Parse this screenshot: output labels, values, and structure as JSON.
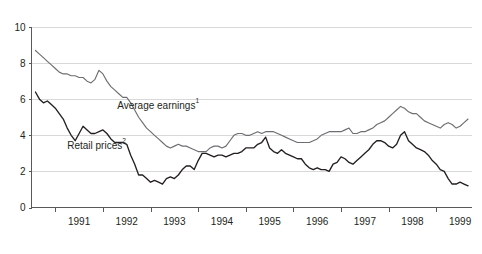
{
  "chart_data": {
    "type": "line",
    "title": "",
    "subtitle": "",
    "xlabel": "",
    "ylabel": "",
    "ylim": [
      0,
      10
    ],
    "xlim": [
      1990.5,
      1999.75
    ],
    "grid": true,
    "legend_position": "inline-annotation",
    "y_ticks": [
      0,
      2,
      4,
      6,
      8,
      10
    ],
    "y_tick_labels": [
      "0",
      "2",
      "4",
      "6",
      "8",
      "10"
    ],
    "x_tick_labels": [
      "1991",
      "1992",
      "1993",
      "1994",
      "1995",
      "1996",
      "1997",
      "1998",
      "1999"
    ],
    "x_tick_positions": [
      1991,
      1992,
      1993,
      1994,
      1995,
      1996,
      1997,
      1998,
      1999
    ],
    "x_boundary_ticks": [
      1991.0,
      1992.0,
      1993.0,
      1994.0,
      1995.0,
      1996.0,
      1997.0,
      1998.0,
      1999.0
    ],
    "annotations": [
      {
        "text": "Average earnings",
        "superscript": "1",
        "x": 1992.3,
        "y": 5.45
      },
      {
        "text": "Retail prices",
        "superscript": "2",
        "x": 1991.25,
        "y": 3.25
      }
    ],
    "series": [
      {
        "name": "Average earnings",
        "superscript": "1",
        "color": "#6d6e71",
        "x": [
          1990.583,
          1990.667,
          1990.75,
          1990.833,
          1990.917,
          1991.0,
          1991.083,
          1991.167,
          1991.25,
          1991.333,
          1991.417,
          1991.5,
          1991.583,
          1991.667,
          1991.75,
          1991.833,
          1991.917,
          1992.0,
          1992.083,
          1992.167,
          1992.25,
          1992.333,
          1992.417,
          1992.5,
          1992.583,
          1992.667,
          1992.75,
          1992.833,
          1992.917,
          1993.0,
          1993.083,
          1993.167,
          1993.25,
          1993.333,
          1993.417,
          1993.5,
          1993.583,
          1993.667,
          1993.75,
          1993.833,
          1993.917,
          1994.0,
          1994.083,
          1994.167,
          1994.25,
          1994.333,
          1994.417,
          1994.5,
          1994.583,
          1994.667,
          1994.75,
          1994.833,
          1994.917,
          1995.0,
          1995.083,
          1995.167,
          1995.25,
          1995.333,
          1995.417,
          1995.5,
          1995.583,
          1995.667,
          1995.75,
          1995.833,
          1995.917,
          1996.0,
          1996.083,
          1996.167,
          1996.25,
          1996.333,
          1996.417,
          1996.5,
          1996.583,
          1996.667,
          1996.75,
          1996.833,
          1996.917,
          1997.0,
          1997.083,
          1997.167,
          1997.25,
          1997.333,
          1997.417,
          1997.5,
          1997.583,
          1997.667,
          1997.75,
          1997.833,
          1997.917,
          1998.0,
          1998.083,
          1998.167,
          1998.25,
          1998.333,
          1998.417,
          1998.5,
          1998.583,
          1998.667,
          1998.75,
          1998.833,
          1998.917,
          1999.0,
          1999.083,
          1999.167,
          1999.25,
          1999.333,
          1999.417,
          1999.5,
          1999.583,
          1999.667
        ],
        "values": [
          8.7,
          8.5,
          8.3,
          8.1,
          7.9,
          7.7,
          7.5,
          7.4,
          7.4,
          7.3,
          7.3,
          7.2,
          7.2,
          7.0,
          6.9,
          7.1,
          7.6,
          7.4,
          7.0,
          6.7,
          6.5,
          6.3,
          6.1,
          6.1,
          5.8,
          5.4,
          5.0,
          4.7,
          4.4,
          4.2,
          4.0,
          3.8,
          3.6,
          3.4,
          3.3,
          3.4,
          3.5,
          3.4,
          3.4,
          3.3,
          3.2,
          3.1,
          3.1,
          3.1,
          3.3,
          3.4,
          3.4,
          3.3,
          3.4,
          3.7,
          4.0,
          4.1,
          4.1,
          4.0,
          4.0,
          4.1,
          4.2,
          4.1,
          4.2,
          4.2,
          4.2,
          4.1,
          4.0,
          3.9,
          3.8,
          3.7,
          3.6,
          3.6,
          3.6,
          3.6,
          3.7,
          3.8,
          4.0,
          4.1,
          4.2,
          4.2,
          4.2,
          4.2,
          4.3,
          4.4,
          4.1,
          4.1,
          4.2,
          4.2,
          4.3,
          4.4,
          4.6,
          4.7,
          4.8,
          5.0,
          5.2,
          5.4,
          5.6,
          5.5,
          5.3,
          5.2,
          5.2,
          5.0,
          4.8,
          4.7,
          4.6,
          4.5,
          4.4,
          4.6,
          4.7,
          4.6,
          4.4,
          4.5,
          4.7,
          4.9
        ]
      },
      {
        "name": "Retail prices",
        "superscript": "2",
        "color": "#231f20",
        "x": [
          1990.583,
          1990.667,
          1990.75,
          1990.833,
          1990.917,
          1991.0,
          1991.083,
          1991.167,
          1991.25,
          1991.333,
          1991.417,
          1991.5,
          1991.583,
          1991.667,
          1991.75,
          1991.833,
          1991.917,
          1992.0,
          1992.083,
          1992.167,
          1992.25,
          1992.333,
          1992.417,
          1992.5,
          1992.583,
          1992.667,
          1992.75,
          1992.833,
          1992.917,
          1993.0,
          1993.083,
          1993.167,
          1993.25,
          1993.333,
          1993.417,
          1993.5,
          1993.583,
          1993.667,
          1993.75,
          1993.833,
          1993.917,
          1994.0,
          1994.083,
          1994.167,
          1994.25,
          1994.333,
          1994.417,
          1994.5,
          1994.583,
          1994.667,
          1994.75,
          1994.833,
          1994.917,
          1995.0,
          1995.083,
          1995.167,
          1995.25,
          1995.333,
          1995.417,
          1995.5,
          1995.583,
          1995.667,
          1995.75,
          1995.833,
          1995.917,
          1996.0,
          1996.083,
          1996.167,
          1996.25,
          1996.333,
          1996.417,
          1996.5,
          1996.583,
          1996.667,
          1996.75,
          1996.833,
          1996.917,
          1997.0,
          1997.083,
          1997.167,
          1997.25,
          1997.333,
          1997.417,
          1997.5,
          1997.583,
          1997.667,
          1997.75,
          1997.833,
          1997.917,
          1998.0,
          1998.083,
          1998.167,
          1998.25,
          1998.333,
          1998.417,
          1998.5,
          1998.583,
          1998.667,
          1998.75,
          1998.833,
          1998.917,
          1999.0,
          1999.083,
          1999.167,
          1999.25,
          1999.333,
          1999.417,
          1999.5,
          1999.583,
          1999.667
        ],
        "values": [
          6.4,
          6.0,
          5.8,
          5.9,
          5.7,
          5.5,
          5.2,
          4.9,
          4.4,
          4.0,
          3.7,
          4.1,
          4.5,
          4.3,
          4.1,
          4.1,
          4.2,
          4.3,
          4.1,
          3.8,
          3.6,
          3.6,
          3.6,
          3.5,
          2.9,
          2.4,
          1.8,
          1.8,
          1.6,
          1.4,
          1.5,
          1.4,
          1.3,
          1.6,
          1.7,
          1.6,
          1.8,
          2.1,
          2.3,
          2.3,
          2.1,
          2.6,
          3.0,
          3.0,
          2.9,
          2.8,
          2.9,
          2.9,
          2.8,
          2.9,
          3.0,
          3.0,
          3.1,
          3.3,
          3.3,
          3.3,
          3.5,
          3.6,
          3.9,
          3.3,
          3.1,
          3.0,
          3.2,
          3.0,
          2.9,
          2.8,
          2.7,
          2.7,
          2.4,
          2.2,
          2.1,
          2.2,
          2.1,
          2.1,
          2.0,
          2.4,
          2.5,
          2.8,
          2.7,
          2.5,
          2.4,
          2.6,
          2.8,
          3.0,
          3.2,
          3.5,
          3.7,
          3.7,
          3.6,
          3.4,
          3.3,
          3.5,
          4.0,
          4.2,
          3.7,
          3.5,
          3.3,
          3.2,
          3.1,
          2.9,
          2.6,
          2.4,
          2.1,
          2.0,
          1.6,
          1.3,
          1.3,
          1.4,
          1.3,
          1.2
        ]
      }
    ]
  }
}
